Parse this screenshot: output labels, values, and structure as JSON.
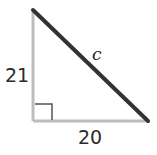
{
  "diagram": {
    "type": "right-triangle",
    "colors": {
      "legs": "#bdbdbd",
      "hypotenuse": "#333333",
      "right_angle_marker": "#555555",
      "text": "#2b2b2b"
    },
    "vertices": {
      "top": [
        33,
        10
      ],
      "right_angle": [
        33,
        121
      ],
      "bottom_right": [
        148,
        121
      ]
    },
    "sides": {
      "vertical_leg": {
        "label": "21"
      },
      "horizontal_leg": {
        "label": "20"
      },
      "hypotenuse": {
        "label": "c"
      }
    },
    "right_angle_marker": {
      "x": 35,
      "y": 104,
      "size": 17
    }
  }
}
